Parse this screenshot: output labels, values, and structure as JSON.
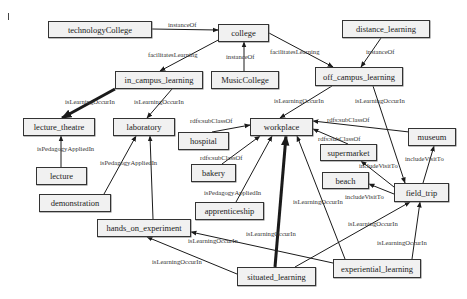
{
  "diagram": {
    "nodes": [
      {
        "id": "technologyCollege",
        "label": "technologyCollege",
        "x": 48,
        "y": 21,
        "w": 104,
        "h": 17
      },
      {
        "id": "college",
        "label": "college",
        "x": 218,
        "y": 24,
        "w": 51,
        "h": 18
      },
      {
        "id": "distance_learning",
        "label": "distance_learning",
        "x": 342,
        "y": 20,
        "w": 88,
        "h": 18
      },
      {
        "id": "in_campus_learning",
        "label": "in_campus_learning",
        "x": 115,
        "y": 71,
        "w": 88,
        "h": 18
      },
      {
        "id": "MusicCollege",
        "label": "MusicCollege",
        "x": 211,
        "y": 71,
        "w": 68,
        "h": 18
      },
      {
        "id": "off_campus_learning",
        "label": "off_campus_learning",
        "x": 315,
        "y": 67,
        "w": 88,
        "h": 19
      },
      {
        "id": "lecture_theatre",
        "label": "lecture_theatre",
        "x": 23,
        "y": 118,
        "w": 72,
        "h": 18
      },
      {
        "id": "laboratory",
        "label": "laboratory",
        "x": 113,
        "y": 118,
        "w": 62,
        "h": 18
      },
      {
        "id": "hospital",
        "label": "hospital",
        "x": 178,
        "y": 132,
        "w": 51,
        "h": 18
      },
      {
        "id": "workplace",
        "label": "workplace",
        "x": 250,
        "y": 118,
        "w": 63,
        "h": 18
      },
      {
        "id": "museum",
        "label": "museum",
        "x": 408,
        "y": 128,
        "w": 48,
        "h": 18
      },
      {
        "id": "supermarket",
        "label": "supermarket",
        "x": 320,
        "y": 144,
        "w": 57,
        "h": 17
      },
      {
        "id": "bakery",
        "label": "bakery",
        "x": 191,
        "y": 164,
        "w": 45,
        "h": 18
      },
      {
        "id": "lecture",
        "label": "lecture",
        "x": 36,
        "y": 167,
        "w": 51,
        "h": 18
      },
      {
        "id": "beach",
        "label": "beach",
        "x": 322,
        "y": 172,
        "w": 47,
        "h": 17
      },
      {
        "id": "field_trip",
        "label": "field_trip",
        "x": 394,
        "y": 183,
        "w": 55,
        "h": 19
      },
      {
        "id": "demonstration",
        "label": "demonstration",
        "x": 39,
        "y": 194,
        "w": 72,
        "h": 18
      },
      {
        "id": "apprenticeship",
        "label": "apprenticeship",
        "x": 195,
        "y": 202,
        "w": 69,
        "h": 18
      },
      {
        "id": "hands_on_experiment",
        "label": "hands_on_experiment",
        "x": 97,
        "y": 219,
        "w": 94,
        "h": 18
      },
      {
        "id": "experiential_learning",
        "label": "experiential_learning",
        "x": 333,
        "y": 259,
        "w": 88,
        "h": 19
      },
      {
        "id": "situated_learning",
        "label": "situated_learning",
        "x": 237,
        "y": 267,
        "w": 79,
        "h": 19
      }
    ],
    "edges": [
      {
        "id": "e1",
        "label": "instanceOf",
        "x1": 152,
        "y1": 29,
        "x2": 218,
        "y2": 30,
        "thick": false,
        "lx": 168,
        "ly": 22
      },
      {
        "id": "e2",
        "label": "facilitatesLearning",
        "x1": 222,
        "y1": 38,
        "x2": 160,
        "y2": 71,
        "thick": false,
        "lx": 148,
        "ly": 52
      },
      {
        "id": "e3",
        "label": "instanceOf",
        "x1": 244,
        "y1": 71,
        "x2": 244,
        "y2": 42,
        "thick": false,
        "lx": 226,
        "ly": 54
      },
      {
        "id": "e4",
        "label": "facilitatesLearning",
        "x1": 269,
        "y1": 33,
        "x2": 333,
        "y2": 67,
        "thick": false,
        "lx": 270,
        "ly": 49
      },
      {
        "id": "e5",
        "label": "instanceOf",
        "x1": 381,
        "y1": 38,
        "x2": 361,
        "y2": 67,
        "thick": false,
        "lx": 366,
        "ly": 49
      },
      {
        "id": "e6",
        "label": "isLearningOccurIn",
        "x1": 115,
        "y1": 89,
        "x2": 62,
        "y2": 118,
        "thick": true,
        "lx": 65,
        "ly": 99
      },
      {
        "id": "e7",
        "label": "isLearningOccurIn",
        "x1": 172,
        "y1": 89,
        "x2": 147,
        "y2": 118,
        "thick": false,
        "lx": 134,
        "ly": 99
      },
      {
        "id": "e8",
        "label": "isLearningOccurIn",
        "x1": 332,
        "y1": 86,
        "x2": 280,
        "y2": 118,
        "thick": false,
        "lx": 274,
        "ly": 98
      },
      {
        "id": "e9",
        "label": "isLearningOccurIn",
        "x1": 373,
        "y1": 86,
        "x2": 405,
        "y2": 183,
        "thick": false,
        "lx": 355,
        "ly": 98
      },
      {
        "id": "e10",
        "label": "rdfs:subClassOf",
        "x1": 212,
        "y1": 132,
        "x2": 250,
        "y2": 125,
        "thick": false,
        "lx": 190,
        "ly": 118
      },
      {
        "id": "e11",
        "label": "rdfs:subClassOf",
        "x1": 418,
        "y1": 133,
        "x2": 313,
        "y2": 121,
        "thick": false,
        "lx": 327,
        "ly": 117
      },
      {
        "id": "e12",
        "label": "rdfs:subClassOf",
        "x1": 348,
        "y1": 144,
        "x2": 313,
        "y2": 129,
        "thick": false,
        "lx": 318,
        "ly": 136
      },
      {
        "id": "e13",
        "label": "rdfs:subClassOf",
        "x1": 222,
        "y1": 164,
        "x2": 260,
        "y2": 136,
        "thick": false,
        "lx": 200,
        "ly": 155
      },
      {
        "id": "e14",
        "label": "isPedagogyAppliedIn",
        "x1": 236,
        "y1": 202,
        "x2": 272,
        "y2": 136,
        "thick": false,
        "lx": 204,
        "ly": 190
      },
      {
        "id": "e15",
        "label": "isLearningOccurIn",
        "x1": 275,
        "y1": 267,
        "x2": 286,
        "y2": 136,
        "thick": true,
        "lx": 246,
        "ly": 231
      },
      {
        "id": "e16",
        "label": "isLearningOccurIn",
        "x1": 345,
        "y1": 259,
        "x2": 297,
        "y2": 136,
        "thick": false,
        "lx": 293,
        "ly": 199
      },
      {
        "id": "e17",
        "label": "isPedagogyAppliedIn",
        "x1": 61,
        "y1": 185,
        "x2": 61,
        "y2": 136,
        "thick": false,
        "lx": 37,
        "ly": 146
      },
      {
        "id": "e18",
        "label": "isPedagogyAppliedIn",
        "x1": 104,
        "y1": 194,
        "x2": 136,
        "y2": 136,
        "thick": false,
        "lx": 100,
        "ly": 160
      },
      {
        "id": "e19",
        "label": "isLearningOccurIn",
        "x1": 153,
        "y1": 219,
        "x2": 150,
        "y2": 136,
        "thick": false,
        "lx": 0,
        "ly": 0,
        "nolabel": true
      },
      {
        "id": "e20",
        "label": "isLearningOccurIn",
        "x1": 333,
        "y1": 263,
        "x2": 191,
        "y2": 232,
        "thick": false,
        "lx": 188,
        "ly": 238
      },
      {
        "id": "e21",
        "label": "isLearningOccurIn",
        "x1": 237,
        "y1": 274,
        "x2": 147,
        "y2": 237,
        "thick": false,
        "lx": 152,
        "ly": 259
      },
      {
        "id": "e22",
        "label": "isLearningOccurIn",
        "x1": 295,
        "y1": 267,
        "x2": 410,
        "y2": 202,
        "thick": false,
        "lx": 348,
        "ly": 221
      },
      {
        "id": "e23",
        "label": "isLearningOccurIn",
        "x1": 412,
        "y1": 259,
        "x2": 420,
        "y2": 202,
        "thick": false,
        "lx": 377,
        "ly": 240
      },
      {
        "id": "e24",
        "label": "includeVisitTo",
        "x1": 423,
        "y1": 183,
        "x2": 434,
        "y2": 146,
        "thick": false,
        "lx": 405,
        "ly": 156
      },
      {
        "id": "e25",
        "label": "includeVisitTo",
        "x1": 394,
        "y1": 187,
        "x2": 361,
        "y2": 161,
        "thick": false,
        "lx": 359,
        "ly": 163
      },
      {
        "id": "e26",
        "label": "includeVisitTo",
        "x1": 394,
        "y1": 194,
        "x2": 369,
        "y2": 184,
        "thick": false,
        "lx": 345,
        "ly": 194
      }
    ],
    "misc": {
      "edge_color": "#1a1a1a",
      "node_fill": "#f1f1f1",
      "node_border": "#333333"
    }
  }
}
